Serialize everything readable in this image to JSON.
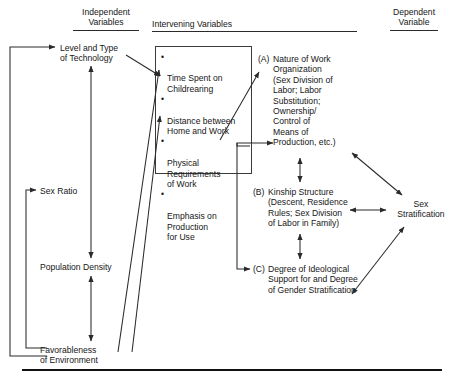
{
  "meta": {
    "figure_type": "flow-diagram",
    "line_color": "#2a2a2a",
    "text_color": "#161616",
    "background": "#ffffff"
  },
  "headers": {
    "independent": "Independent\nVariables",
    "intervening": "Intervening Variables",
    "dependent": "Dependent\nVariable"
  },
  "independent": {
    "technology": "Level and Type\nof Technology",
    "sex_ratio": "Sex Ratio",
    "population_density": "Population Density",
    "environment": "Favorableness\nof Environment"
  },
  "intervening_box": {
    "bullet": "•",
    "items": [
      "Time Spent on\nChildrearing",
      "Distance between\nHome and Work",
      "Physical\nRequirements\nof Work",
      "Emphasis on\nProduction\nfor Use"
    ]
  },
  "outcomes": [
    {
      "tag": "(A)",
      "text": "Nature of Work\nOrganization\n(Sex Division of\nLabor; Labor\nSubstitution;\nOwnership/\nControl of\nMeans of\nProduction, etc.)"
    },
    {
      "tag": "(B)",
      "text": "Kinship Structure\n(Descent, Residence\nRules; Sex Division\nof Labor in Family)"
    },
    {
      "tag": "(C)",
      "text": "Degree of Ideological\nSupport for and Degree\nof Gender Stratification"
    }
  ],
  "dependent": {
    "outcome": "Sex\nStratification"
  }
}
